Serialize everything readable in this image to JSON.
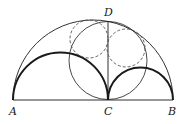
{
  "diagram": {
    "type": "arbelos",
    "labels": {
      "A": "A",
      "B": "B",
      "C": "C",
      "D": "D"
    },
    "points": {
      "A": [
        13,
        100
      ],
      "C": [
        108,
        100
      ],
      "B": [
        173,
        100
      ],
      "D": [
        108,
        21
      ]
    },
    "elements": [
      {
        "name": "outer-semicircle",
        "diameter": "AB",
        "style": "thin"
      },
      {
        "name": "left-semicircle",
        "diameter": "AC",
        "style": "thick"
      },
      {
        "name": "right-semicircle",
        "diameter": "CB",
        "style": "thick"
      },
      {
        "name": "baseline",
        "segment": "AB",
        "style": "thin"
      },
      {
        "name": "segment-CD",
        "segment": "CD",
        "style": "thin"
      },
      {
        "name": "circle-CD",
        "diameter": "CD",
        "style": "thin"
      },
      {
        "name": "twin-circle-left",
        "style": "dashed"
      },
      {
        "name": "twin-circle-right",
        "style": "dashed"
      }
    ],
    "colors": {
      "stroke": "#1a1a1a",
      "dashed": "#555555"
    }
  }
}
